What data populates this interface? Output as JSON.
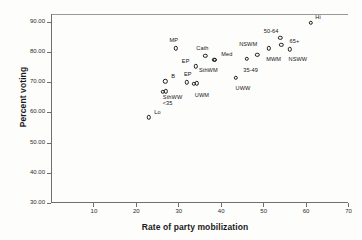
{
  "chart_data": {
    "type": "scatter",
    "title": "",
    "xlabel": "Rate of party mobilization",
    "ylabel": "Percent voting",
    "xlim": [
      0,
      70
    ],
    "ylim": [
      30,
      92.5
    ],
    "grid": false,
    "legend": "none",
    "xticks": [
      "10",
      "20",
      "30",
      "40",
      "50",
      "60",
      "70"
    ],
    "xtick_values": [
      10,
      20,
      30,
      40,
      50,
      60,
      70
    ],
    "yticks": [
      "30.00",
      "40.00",
      "50.00",
      "60.00",
      "70.00",
      "80.00",
      "90.00"
    ],
    "ytick_values": [
      30,
      40,
      50,
      60,
      70,
      80,
      90
    ],
    "points": [
      {
        "label": "Lo",
        "x": 23.0,
        "y": 58.4,
        "label_dx": 9,
        "label_dy": -5
      },
      {
        "label": "SthWW",
        "x": 26.3,
        "y": 66.8,
        "label_dx": 10,
        "label_dy": 5
      },
      {
        "label": "<35",
        "x": 27.0,
        "y": 66.9,
        "label_dx": 2,
        "label_dy": 12
      },
      {
        "label": "B",
        "x": 26.9,
        "y": 70.2,
        "label_dx": 8,
        "label_dy": -5
      },
      {
        "label": "MP",
        "x": 29.4,
        "y": 81.2,
        "label_dx": -2,
        "label_dy": -8
      },
      {
        "label": "EP",
        "x": 32.0,
        "y": 69.9,
        "label_dx": 1,
        "label_dy": -8
      },
      {
        "label": "UWM",
        "x": 33.7,
        "y": 69.5,
        "label_dx": 8,
        "label_dy": 11
      },
      {
        "label": "EP2",
        "x": 34.3,
        "y": 69.6,
        "label_dx": 0,
        "label_dy": 0,
        "hide_label": true
      },
      {
        "label": "EP",
        "x": 34.1,
        "y": 75.2,
        "label_dx": -10,
        "label_dy": -5
      },
      {
        "label": "Cath",
        "x": 36.4,
        "y": 78.6,
        "label_dx": -3,
        "label_dy": -8
      },
      {
        "label": "SthWM",
        "x": 38.5,
        "y": 77.3,
        "label_dx": -6,
        "label_dy": 10
      },
      {
        "label": "Med",
        "x": 38.6,
        "y": 77.4,
        "label_dx": 12,
        "label_dy": -6
      },
      {
        "label": "UWW",
        "x": 43.6,
        "y": 71.5,
        "label_dx": 7,
        "label_dy": 10
      },
      {
        "label": "35-49",
        "x": 46.1,
        "y": 77.7,
        "label_dx": 4,
        "label_dy": 11
      },
      {
        "label": "NSWM",
        "x": 48.6,
        "y": 79.1,
        "label_dx": -9,
        "label_dy": -11
      },
      {
        "label": "MWM",
        "x": 51.3,
        "y": 81.1,
        "label_dx": 5,
        "label_dy": 11
      },
      {
        "label": "50-64",
        "x": 54.0,
        "y": 84.7,
        "label_dx": -9,
        "label_dy": -7
      },
      {
        "label": "65+",
        "x": 54.3,
        "y": 82.4,
        "label_dx": 13,
        "label_dy": -4
      },
      {
        "label": "NSWW",
        "x": 56.3,
        "y": 80.8,
        "label_dx": 8,
        "label_dy": 10
      },
      {
        "label": "Hi",
        "x": 61.3,
        "y": 89.5,
        "label_dx": 7,
        "label_dy": -6
      }
    ]
  }
}
